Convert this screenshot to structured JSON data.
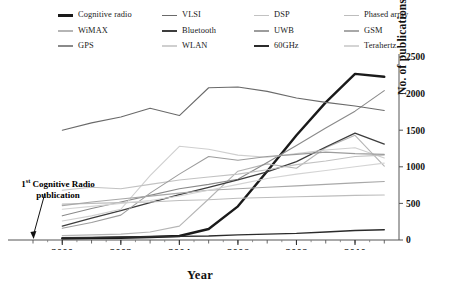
{
  "chart_data": {
    "type": "line",
    "title": "",
    "subtitle": "",
    "xlabel": "Year",
    "ylabel": "No. of publications",
    "x": [
      2000,
      2001,
      2002,
      2003,
      2004,
      2005,
      2006,
      2007,
      2008,
      2009,
      2010,
      2011
    ],
    "xlim": [
      1999,
      2011.4
    ],
    "ylim": [
      0,
      2500
    ],
    "ytick_labels": [
      "0",
      "500",
      "1000",
      "1500",
      "2000",
      "2500"
    ],
    "yticks": [
      0,
      500,
      1000,
      1500,
      2000,
      2500
    ],
    "xtick_labels": [
      "2000",
      "2002",
      "2004",
      "2006",
      "2008",
      "2010"
    ],
    "xticks": [
      2000,
      2002,
      2004,
      2006,
      2008,
      2010
    ],
    "minor_xticks_every": 1,
    "grid": false,
    "legend_position": "top",
    "legend_columns": 4,
    "annotations": [
      {
        "text_line1": "1st Cognitive Radio",
        "text_line2": "publication",
        "superscript": "st",
        "points_to_x": 1999,
        "points_to_y": 0
      }
    ],
    "series": [
      {
        "name": "Cognitive radio",
        "color": "#1a1a1a",
        "width": 2.4,
        "values": [
          20,
          25,
          30,
          40,
          55,
          150,
          460,
          940,
          1430,
          1880,
          2270,
          2230
        ]
      },
      {
        "name": "WiMAX",
        "color": "#b5b5b5",
        "width": 1.1,
        "values": [
          60,
          70,
          80,
          110,
          190,
          560,
          940,
          1040,
          980,
          1260,
          1430,
          1010
        ]
      },
      {
        "name": "GPS",
        "color": "#8a8a8a",
        "width": 1.1,
        "values": [
          330,
          430,
          520,
          610,
          700,
          760,
          830,
          1060,
          1290,
          1530,
          1760,
          2040
        ]
      },
      {
        "name": "VLSI",
        "color": "#6a6a6a",
        "width": 1.1,
        "values": [
          1500,
          1600,
          1680,
          1800,
          1700,
          2080,
          2090,
          2030,
          1940,
          1880,
          1830,
          1770
        ]
      },
      {
        "name": "Bluetooth",
        "color": "#3d3d3d",
        "width": 1.3,
        "values": [
          190,
          300,
          400,
          510,
          620,
          720,
          820,
          930,
          1070,
          1270,
          1460,
          1310
        ]
      },
      {
        "name": "WLAN",
        "color": "#cfcfcf",
        "width": 1.1,
        "values": [
          260,
          330,
          420,
          880,
          1280,
          1240,
          1160,
          1130,
          1180,
          1230,
          1260,
          1120
        ]
      },
      {
        "name": "DSP",
        "color": "#c2c2c2",
        "width": 1.1,
        "values": [
          680,
          720,
          700,
          760,
          820,
          860,
          900,
          960,
          1030,
          1080,
          1140,
          1160
        ]
      },
      {
        "name": "UWB",
        "color": "#9c9c9c",
        "width": 1.1,
        "values": [
          160,
          240,
          340,
          640,
          900,
          1140,
          1090,
          1140,
          1170,
          1200,
          1180,
          1170
        ]
      },
      {
        "name": "60GHz",
        "color": "#2b2b2b",
        "width": 1.4,
        "values": [
          30,
          35,
          40,
          45,
          50,
          55,
          70,
          80,
          90,
          110,
          130,
          140
        ]
      },
      {
        "name": "Phased array",
        "color": "#bdbdbd",
        "width": 1.1,
        "values": [
          490,
          500,
          510,
          520,
          540,
          550,
          570,
          580,
          590,
          600,
          610,
          615
        ]
      },
      {
        "name": "GSM",
        "color": "#a8a8a8",
        "width": 1.1,
        "values": [
          470,
          520,
          560,
          600,
          640,
          680,
          700,
          720,
          740,
          760,
          780,
          800
        ]
      },
      {
        "name": "Terahertz",
        "color": "#d4d4d4",
        "width": 1.1,
        "values": [
          420,
          460,
          500,
          540,
          600,
          680,
          760,
          840,
          900,
          950,
          1000,
          1050
        ]
      }
    ]
  },
  "legend": {
    "columns": [
      [
        {
          "label": "Cognitive radio",
          "color": "#1a1a1a",
          "width": 2.6
        },
        {
          "label": "WiMAX",
          "color": "#b5b5b5",
          "width": 1.6
        },
        {
          "label": "GPS",
          "color": "#8a8a8a",
          "width": 1.6
        }
      ],
      [
        {
          "label": "VLSI",
          "color": "#6a6a6a",
          "width": 1.6
        },
        {
          "label": "Bluetooth",
          "color": "#3d3d3d",
          "width": 2.0
        },
        {
          "label": "WLAN",
          "color": "#cfcfcf",
          "width": 1.6
        }
      ],
      [
        {
          "label": "DSP",
          "color": "#c2c2c2",
          "width": 1.6
        },
        {
          "label": "UWB",
          "color": "#9c9c9c",
          "width": 1.6
        },
        {
          "label": "60GHz",
          "color": "#2b2b2b",
          "width": 2.2
        }
      ],
      [
        {
          "label": "Phased array",
          "color": "#bdbdbd",
          "width": 1.6
        },
        {
          "label": "GSM",
          "color": "#a8a8a8",
          "width": 1.6
        },
        {
          "label": "Terahertz",
          "color": "#d4d4d4",
          "width": 1.6
        }
      ]
    ]
  },
  "axis": {
    "x_title": "Year",
    "y_title": "No. of publications"
  },
  "annotation": {
    "prefix": "1",
    "superscript": "st",
    "rest": " Cognitive Radio",
    "line2": "publication"
  }
}
